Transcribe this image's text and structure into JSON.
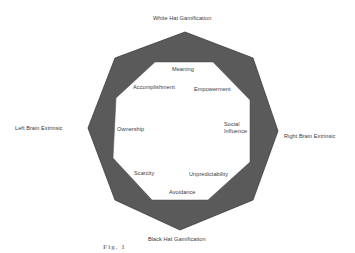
{
  "diagram": {
    "type": "octagon-framework",
    "axes": {
      "top": "White Hat Gamification",
      "bottom": "Black Hat Gamification",
      "left": "Left Brain Extrinsic",
      "right": "Right  Brain Extrinsic"
    },
    "core_drives": {
      "meaning": "Meaning",
      "empowerment": "Empowerment",
      "social_influence_line1": "Social",
      "social_influence_line2": "Influence",
      "unpredictability": "Unpredictability",
      "avoidance": "Avoidance",
      "scarcity": "Scarcity",
      "ownership": "Ownership",
      "accomplishment": "Accomplishment"
    },
    "caption_fragment": "Fig. 1",
    "colors": {
      "ring_fill": "#5a5a5a",
      "ring_stroke": "#3c3c3c",
      "inner_fill": "#ffffff",
      "text": "#3a3a3a"
    }
  }
}
